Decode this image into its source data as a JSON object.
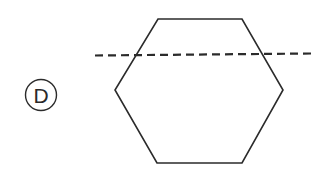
{
  "option": {
    "letter": "D",
    "circled": true
  },
  "figure": {
    "shape": "hexagon",
    "orientation": "flat-top",
    "vertices": [
      [
        158,
        19
      ],
      [
        242,
        19
      ],
      [
        283,
        90
      ],
      [
        242,
        163
      ],
      [
        157,
        163
      ],
      [
        115,
        90
      ]
    ],
    "stroke_color": "#2b2b2b",
    "fill_color": "#ffffff"
  },
  "fold_line": {
    "style": "dashed",
    "start": [
      95,
      55.5
    ],
    "end": [
      311,
      53.5
    ],
    "dash_length": 8,
    "gap_length": 5,
    "color": "#2b2b2b"
  },
  "colors": {
    "background": "#ffffff",
    "ink": "#2b2b2b"
  }
}
